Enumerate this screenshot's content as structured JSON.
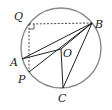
{
  "diagram": {
    "type": "circle-geometry",
    "circle": {
      "center": "O",
      "cx": 61,
      "cy": 48,
      "r": 40,
      "stroke": "#7a7a7a"
    },
    "points": {
      "Q": {
        "label": "Q",
        "x": 29,
        "y": 24
      },
      "B": {
        "label": "B",
        "x": 92,
        "y": 23
      },
      "O": {
        "label": "O",
        "x": 61,
        "y": 49
      },
      "A": {
        "label": "A",
        "x": 22,
        "y": 59
      },
      "P": {
        "label": "P",
        "x": 29,
        "y": 72
      },
      "C": {
        "label": "C",
        "x": 63,
        "y": 88
      }
    },
    "solid_segments": [
      "AB",
      "AO",
      "OB",
      "PB",
      "OC",
      "BC"
    ],
    "dashed_segments": [
      "QB",
      "QP"
    ],
    "right_angle_at": "Q",
    "line_color": "#222222"
  }
}
